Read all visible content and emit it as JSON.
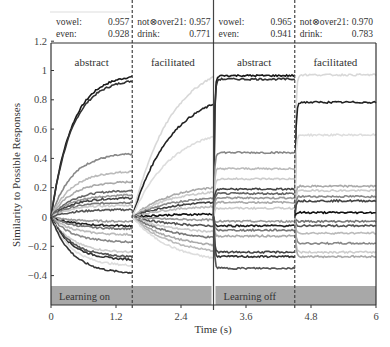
{
  "chart_data": {
    "type": "line",
    "title": "",
    "xlabel": "Time (s)",
    "ylabel": "Similarity to Possible Responses",
    "xlim": [
      0,
      6
    ],
    "ylim": [
      -0.6,
      1.2
    ],
    "x_ticks": [
      "0",
      "1.2",
      "2.4",
      "3.6",
      "4.8",
      "6"
    ],
    "x_tick_values": [
      0,
      1.2,
      2.4,
      3.6,
      4.8,
      6
    ],
    "y_ticks": [
      "1.2",
      "1",
      "0.8",
      "0.6",
      "0.4",
      "0.2",
      "0",
      "−0.2",
      "−0.4"
    ],
    "y_tick_values": [
      1.2,
      1.0,
      0.8,
      0.6,
      0.4,
      0.2,
      0,
      -0.2,
      -0.4
    ],
    "grid": false,
    "panels": [
      {
        "label": "abstract",
        "x_start": 0,
        "x_end": 1.5,
        "mode": "learning"
      },
      {
        "label": "facilitated",
        "x_start": 1.5,
        "x_end": 3.0,
        "mode": "learning"
      },
      {
        "label": "abstract",
        "x_start": 3.0,
        "x_end": 4.5,
        "mode": "static"
      },
      {
        "label": "facilitated",
        "x_start": 4.5,
        "x_end": 6.0,
        "mode": "static"
      }
    ],
    "phase_bars": [
      {
        "label": "Learning on",
        "x_start": 0,
        "x_end": 3.0
      },
      {
        "label": "Learning off",
        "x_start": 3.0,
        "x_end": 6.0
      }
    ],
    "scores": [
      {
        "rows": [
          {
            "name": "vowel:",
            "value": "0.957"
          },
          {
            "name": "even:",
            "value": "0.928"
          }
        ]
      },
      {
        "rows": [
          {
            "name": "not⊗over21:",
            "value": "0.957"
          },
          {
            "name": "drink:",
            "value": "0.771"
          }
        ]
      },
      {
        "rows": [
          {
            "name": "vowel:",
            "value": "0.965"
          },
          {
            "name": "even:",
            "value": "0.941"
          }
        ]
      },
      {
        "rows": [
          {
            "name": "not⊗over21:",
            "value": "0.970"
          },
          {
            "name": "drink:",
            "value": "0.783"
          }
        ]
      }
    ],
    "series": [
      {
        "panel": 0,
        "final": 0.957,
        "color": "#1a1a1a"
      },
      {
        "panel": 0,
        "final": 0.928,
        "color": "#333333"
      },
      {
        "panel": 0,
        "final": 0.43,
        "color": "#888888"
      },
      {
        "panel": 0,
        "final": 0.31,
        "color": "#bbbbbb"
      },
      {
        "panel": 0,
        "final": 0.24,
        "color": "#aaaaaa"
      },
      {
        "panel": 0,
        "final": 0.18,
        "color": "#666666"
      },
      {
        "panel": 0,
        "final": 0.15,
        "color": "#999999"
      },
      {
        "panel": 0,
        "final": 0.13,
        "color": "#444444"
      },
      {
        "panel": 0,
        "final": 0.1,
        "color": "#777777"
      },
      {
        "panel": 0,
        "final": 0.08,
        "color": "#cccccc"
      },
      {
        "panel": 0,
        "final": 0.05,
        "color": "#555555"
      },
      {
        "panel": 0,
        "final": -0.03,
        "color": "#999999"
      },
      {
        "panel": 0,
        "final": -0.06,
        "color": "#222222"
      },
      {
        "panel": 0,
        "final": -0.08,
        "color": "#777777"
      },
      {
        "panel": 0,
        "final": -0.12,
        "color": "#bbbbbb"
      },
      {
        "panel": 0,
        "final": -0.17,
        "color": "#888888"
      },
      {
        "panel": 0,
        "final": -0.24,
        "color": "#cccccc"
      },
      {
        "panel": 0,
        "final": -0.27,
        "color": "#555555"
      },
      {
        "panel": 0,
        "final": -0.29,
        "color": "#333333"
      },
      {
        "panel": 0,
        "final": -0.33,
        "color": "#dddddd"
      },
      {
        "panel": 0,
        "final": -0.38,
        "color": "#333333"
      },
      {
        "panel": 1,
        "final": 0.957,
        "color": "#d8d8d8"
      },
      {
        "panel": 1,
        "final": 0.771,
        "color": "#222222"
      },
      {
        "panel": 1,
        "final": 0.55,
        "color": "#dddddd"
      },
      {
        "panel": 1,
        "final": 0.2,
        "color": "#aaaaaa"
      },
      {
        "panel": 1,
        "final": 0.17,
        "color": "#cccccc"
      },
      {
        "panel": 1,
        "final": 0.13,
        "color": "#888888"
      },
      {
        "panel": 1,
        "final": 0.1,
        "color": "#444444"
      },
      {
        "panel": 1,
        "final": 0.07,
        "color": "#bbbbbb"
      },
      {
        "panel": 1,
        "final": 0.02,
        "color": "#111111"
      },
      {
        "panel": 1,
        "final": -0.02,
        "color": "#999999"
      },
      {
        "panel": 1,
        "final": -0.06,
        "color": "#555555"
      },
      {
        "panel": 1,
        "final": -0.1,
        "color": "#cccccc"
      },
      {
        "panel": 1,
        "final": -0.14,
        "color": "#777777"
      },
      {
        "panel": 1,
        "final": -0.19,
        "color": "#aaaaaa"
      },
      {
        "panel": 1,
        "final": -0.23,
        "color": "#bbbbbb"
      },
      {
        "panel": 1,
        "final": -0.28,
        "color": "#dddddd"
      },
      {
        "panel": 2,
        "final": 0.965,
        "color": "#1a1a1a"
      },
      {
        "panel": 2,
        "final": 0.941,
        "color": "#333333"
      },
      {
        "panel": 2,
        "final": 0.44,
        "color": "#888888"
      },
      {
        "panel": 2,
        "final": 0.33,
        "color": "#bbbbbb"
      },
      {
        "panel": 2,
        "final": 0.26,
        "color": "#cccccc"
      },
      {
        "panel": 2,
        "final": 0.19,
        "color": "#444444"
      },
      {
        "panel": 2,
        "final": 0.16,
        "color": "#666666"
      },
      {
        "panel": 2,
        "final": 0.13,
        "color": "#999999"
      },
      {
        "panel": 2,
        "final": 0.1,
        "color": "#aaaaaa"
      },
      {
        "panel": 2,
        "final": 0.06,
        "color": "#cccccc"
      },
      {
        "panel": 2,
        "final": -0.03,
        "color": "#999999"
      },
      {
        "panel": 2,
        "final": -0.06,
        "color": "#222222"
      },
      {
        "panel": 2,
        "final": -0.09,
        "color": "#777777"
      },
      {
        "panel": 2,
        "final": -0.13,
        "color": "#aaaaaa"
      },
      {
        "panel": 2,
        "final": -0.24,
        "color": "#444444"
      },
      {
        "panel": 2,
        "final": -0.27,
        "color": "#333333"
      },
      {
        "panel": 2,
        "final": -0.35,
        "color": "#555555"
      },
      {
        "panel": 3,
        "final": 0.97,
        "color": "#d8d8d8"
      },
      {
        "panel": 3,
        "final": 0.783,
        "color": "#222222"
      },
      {
        "panel": 3,
        "final": 0.56,
        "color": "#dddddd"
      },
      {
        "panel": 3,
        "final": 0.21,
        "color": "#aaaaaa"
      },
      {
        "panel": 3,
        "final": 0.18,
        "color": "#cccccc"
      },
      {
        "panel": 3,
        "final": 0.14,
        "color": "#888888"
      },
      {
        "panel": 3,
        "final": 0.11,
        "color": "#444444"
      },
      {
        "panel": 3,
        "final": 0.03,
        "color": "#111111"
      },
      {
        "panel": 3,
        "final": -0.03,
        "color": "#777777"
      },
      {
        "panel": 3,
        "final": -0.06,
        "color": "#555555"
      },
      {
        "panel": 3,
        "final": -0.11,
        "color": "#bbbbbb"
      },
      {
        "panel": 3,
        "final": -0.18,
        "color": "#888888"
      },
      {
        "panel": 3,
        "final": -0.24,
        "color": "#cccccc"
      },
      {
        "panel": 3,
        "final": -0.27,
        "color": "#aaaaaa"
      }
    ]
  },
  "colors": {
    "axis": "#333333",
    "phase_bar": "#a8a8a8",
    "divider": "#444444"
  }
}
